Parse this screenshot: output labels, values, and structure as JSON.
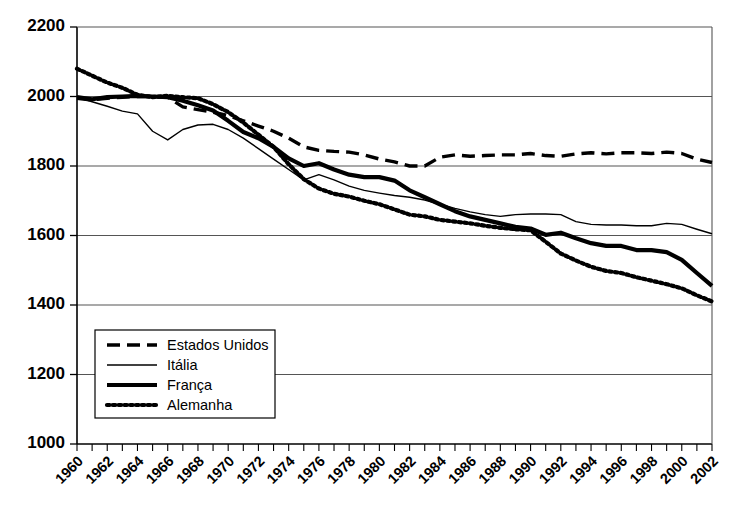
{
  "chart_data": {
    "type": "line",
    "title": "",
    "xlabel": "",
    "ylabel": "",
    "xlim": [
      1960,
      2002
    ],
    "ylim": [
      1000,
      2200
    ],
    "grid": true,
    "legend_position": "bottom-left",
    "y_ticks": [
      2200,
      2000,
      1800,
      1600,
      1400,
      1200,
      1000
    ],
    "x_ticks": [
      1960,
      1962,
      1964,
      1966,
      1968,
      1970,
      1972,
      1974,
      1976,
      1978,
      1980,
      1982,
      1984,
      1986,
      1988,
      1990,
      1992,
      1994,
      1996,
      1998,
      2000,
      2002
    ],
    "x_minor_step": 1,
    "x": [
      1960,
      1961,
      1962,
      1963,
      1964,
      1965,
      1966,
      1967,
      1968,
      1969,
      1970,
      1971,
      1972,
      1973,
      1974,
      1975,
      1976,
      1977,
      1978,
      1979,
      1980,
      1981,
      1982,
      1983,
      1984,
      1985,
      1986,
      1987,
      1988,
      1989,
      1990,
      1991,
      1992,
      1993,
      1994,
      1995,
      1996,
      1997,
      1998,
      1999,
      2000,
      2001,
      2002
    ],
    "series": [
      {
        "name": "Estados Unidos",
        "style": "dashed",
        "color": "#000000",
        "values": [
          1995,
          1990,
          1995,
          1998,
          2000,
          2000,
          1998,
          1970,
          1962,
          1955,
          1945,
          1930,
          1915,
          1900,
          1880,
          1855,
          1845,
          1842,
          1840,
          1832,
          1820,
          1812,
          1800,
          1800,
          1825,
          1832,
          1828,
          1830,
          1832,
          1832,
          1836,
          1830,
          1828,
          1835,
          1838,
          1835,
          1838,
          1838,
          1836,
          1840,
          1836,
          1820,
          1810
        ]
      },
      {
        "name": "Itália",
        "style": "thin-solid",
        "color": "#000000",
        "values": [
          1998,
          1985,
          1972,
          1958,
          1950,
          1900,
          1875,
          1905,
          1918,
          1920,
          1905,
          1880,
          1850,
          1820,
          1790,
          1760,
          1775,
          1760,
          1742,
          1730,
          1722,
          1715,
          1710,
          1702,
          1690,
          1678,
          1668,
          1660,
          1655,
          1660,
          1662,
          1662,
          1660,
          1640,
          1632,
          1630,
          1630,
          1628,
          1628,
          1635,
          1632,
          1618,
          1605
        ]
      },
      {
        "name": "França",
        "style": "thick-solid",
        "color": "#000000",
        "values": [
          1998,
          1992,
          1998,
          2000,
          2002,
          2000,
          1998,
          1988,
          1975,
          1960,
          1930,
          1898,
          1880,
          1855,
          1822,
          1800,
          1808,
          1790,
          1775,
          1768,
          1768,
          1758,
          1730,
          1710,
          1690,
          1670,
          1655,
          1645,
          1635,
          1625,
          1620,
          1602,
          1608,
          1592,
          1578,
          1570,
          1570,
          1558,
          1558,
          1552,
          1530,
          1492,
          1455
        ]
      },
      {
        "name": "Alemanha",
        "style": "dotted",
        "color": "#000000",
        "values": [
          2080,
          2060,
          2040,
          2025,
          2005,
          1998,
          2002,
          1998,
          1995,
          1978,
          1955,
          1925,
          1890,
          1855,
          1805,
          1762,
          1735,
          1720,
          1712,
          1700,
          1690,
          1675,
          1660,
          1655,
          1645,
          1640,
          1635,
          1628,
          1622,
          1618,
          1615,
          1582,
          1548,
          1528,
          1510,
          1498,
          1492,
          1480,
          1470,
          1460,
          1448,
          1428,
          1410
        ]
      }
    ]
  },
  "legend": {
    "items": [
      {
        "label": "Estados Unidos",
        "style": "dashed"
      },
      {
        "label": "Itália",
        "style": "thin-solid"
      },
      {
        "label": "França",
        "style": "thick-solid"
      },
      {
        "label": "Alemanha",
        "style": "dotted"
      }
    ]
  }
}
